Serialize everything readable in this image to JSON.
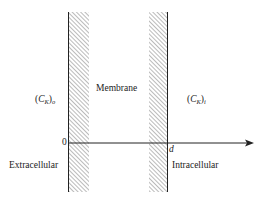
{
  "diagram": {
    "regions": {
      "left_concentration": {
        "symbol": "C",
        "subscript_K": "K",
        "outer_subscript": "o"
      },
      "membrane_label": "Membrane",
      "right_concentration": {
        "symbol": "C",
        "subscript_K": "K",
        "outer_subscript": "i"
      },
      "left_side_label": "Extracellular",
      "right_side_label": "Intracellular"
    },
    "axis": {
      "origin_label": "0",
      "end_label": "d"
    },
    "colors": {
      "line": "#222222",
      "hatch": "#666666"
    }
  }
}
